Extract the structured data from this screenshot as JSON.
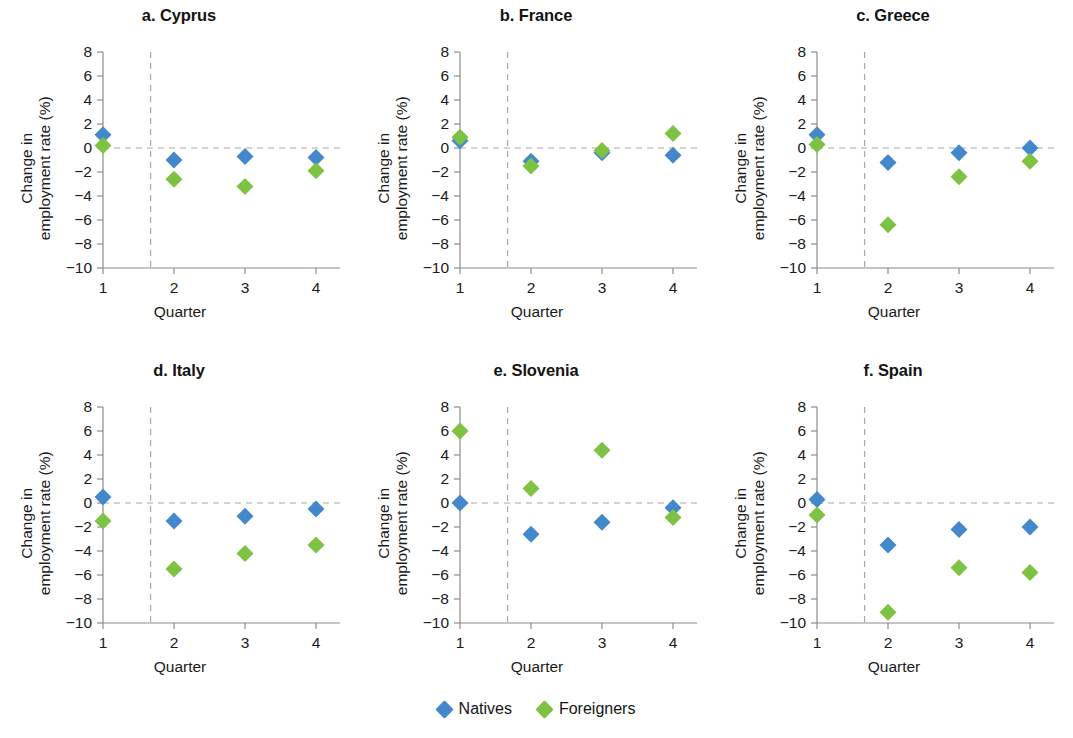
{
  "figure": {
    "legend": {
      "entries": [
        {
          "label": "Natives",
          "color": "#4488cc",
          "marker": "diamond"
        },
        {
          "label": "Foreigners",
          "color": "#7dc242",
          "marker": "diamond"
        }
      ]
    }
  },
  "chart_data": {
    "type": "scatter",
    "title": "",
    "xlabel": "Quarter",
    "ylabel": "Change in employment rate (%)",
    "ylabel_lines": [
      "Change in",
      "employment rate (%)"
    ],
    "x": [
      1,
      2,
      3,
      4
    ],
    "xtick_labels": [
      "1",
      "2",
      "3",
      "4"
    ],
    "ytick_labels": [
      "8",
      "6",
      "4",
      "2",
      "0",
      "−2",
      "−4",
      "−6",
      "−8",
      "−10"
    ],
    "yticks": [
      8,
      6,
      4,
      2,
      0,
      -2,
      -4,
      -6,
      -8,
      -10
    ],
    "xlim": [
      0.75,
      4.3
    ],
    "ylim": [
      -10,
      8
    ],
    "grid": false,
    "legend_position": "bottom-center",
    "annotations": [
      {
        "type": "hline",
        "y": 0,
        "style": "dashed",
        "color": "#a8a8a8"
      },
      {
        "type": "vline",
        "x": 1.67,
        "style": "dashed",
        "color": "#a8a8a8"
      }
    ],
    "series_colors": {
      "Natives": "#4488cc",
      "Foreigners": "#7dc242"
    },
    "panels": [
      {
        "id": "cyprus",
        "title": "a. Cyprus",
        "series": [
          {
            "name": "Natives",
            "values": [
              1.1,
              -1.0,
              -0.7,
              -0.8
            ]
          },
          {
            "name": "Foreigners",
            "values": [
              0.2,
              -2.6,
              -3.2,
              -1.9
            ]
          }
        ]
      },
      {
        "id": "france",
        "title": "b. France",
        "series": [
          {
            "name": "Natives",
            "values": [
              0.6,
              -1.1,
              -0.4,
              -0.6
            ]
          },
          {
            "name": "Foreigners",
            "values": [
              0.9,
              -1.5,
              -0.2,
              1.2
            ]
          }
        ]
      },
      {
        "id": "greece",
        "title": "c. Greece",
        "series": [
          {
            "name": "Natives",
            "values": [
              1.1,
              -1.2,
              -0.4,
              0.0
            ]
          },
          {
            "name": "Foreigners",
            "values": [
              0.3,
              -6.4,
              -2.4,
              -1.1
            ]
          }
        ]
      },
      {
        "id": "italy",
        "title": "d. Italy",
        "series": [
          {
            "name": "Natives",
            "values": [
              0.5,
              -1.5,
              -1.1,
              -0.5
            ]
          },
          {
            "name": "Foreigners",
            "values": [
              -1.5,
              -5.5,
              -4.2,
              -3.5
            ]
          }
        ]
      },
      {
        "id": "slovenia",
        "title": "e. Slovenia",
        "series": [
          {
            "name": "Natives",
            "values": [
              0.0,
              -2.6,
              -1.6,
              -0.4
            ]
          },
          {
            "name": "Foreigners",
            "values": [
              6.0,
              1.2,
              4.4,
              -1.2
            ]
          }
        ]
      },
      {
        "id": "spain",
        "title": "f. Spain",
        "series": [
          {
            "name": "Natives",
            "values": [
              0.3,
              -3.5,
              -2.2,
              -2.0
            ]
          },
          {
            "name": "Foreigners",
            "values": [
              -1.0,
              -9.1,
              -5.4,
              -5.8
            ]
          }
        ]
      }
    ]
  }
}
